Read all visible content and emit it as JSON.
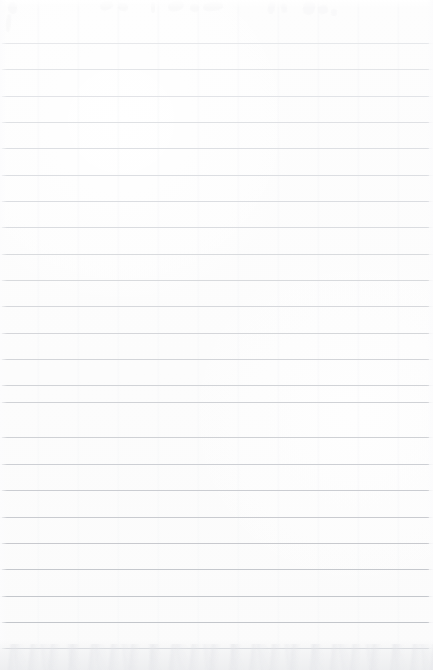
{
  "document": {
    "kind": "scanned-ruled-paper",
    "title": "",
    "text_content": "",
    "has_text": false,
    "note": ""
  },
  "page": {
    "width": 433,
    "height": 670,
    "background_color": "#fdfdfd",
    "paper_tint": "#fcfcfc"
  },
  "ruling": {
    "line_count": 24,
    "first_line_y": 43,
    "spacing": 26.3,
    "line_thickness": 1,
    "line_start_x": 2,
    "line_end_x": 429,
    "color_top": "#e2e4e7",
    "color_middle": "#d9dbdf",
    "color_bottom": "#c3c6cb",
    "lines": [
      {
        "index": 1,
        "y": 43,
        "color": "#e3e5e8",
        "opacity": 0.85,
        "x1": 2,
        "x2": 429
      },
      {
        "index": 2,
        "y": 69,
        "color": "#e0e2e6",
        "opacity": 0.88,
        "x1": 2,
        "x2": 429
      },
      {
        "index": 3,
        "y": 96,
        "color": "#dfe1e5",
        "opacity": 0.9,
        "x1": 2,
        "x2": 429
      },
      {
        "index": 4,
        "y": 122,
        "color": "#dcdee2",
        "opacity": 0.9,
        "x1": 2,
        "x2": 429
      },
      {
        "index": 5,
        "y": 148,
        "color": "#dbdde1",
        "opacity": 0.92,
        "x1": 2,
        "x2": 429
      },
      {
        "index": 6,
        "y": 175,
        "color": "#dadce0",
        "opacity": 0.92,
        "x1": 2,
        "x2": 429
      },
      {
        "index": 7,
        "y": 201,
        "color": "#d9dbdf",
        "opacity": 0.93,
        "x1": 2,
        "x2": 429
      },
      {
        "index": 8,
        "y": 227,
        "color": "#d8dade",
        "opacity": 0.93,
        "x1": 2,
        "x2": 429
      },
      {
        "index": 9,
        "y": 254,
        "color": "#d7d9dd",
        "opacity": 0.94,
        "x1": 2,
        "x2": 429
      },
      {
        "index": 10,
        "y": 280,
        "color": "#d6d8dc",
        "opacity": 0.94,
        "x1": 2,
        "x2": 429
      },
      {
        "index": 11,
        "y": 306,
        "color": "#d5d7db",
        "opacity": 0.95,
        "x1": 2,
        "x2": 429
      },
      {
        "index": 12,
        "y": 333,
        "color": "#d3d5d9",
        "opacity": 0.95,
        "x1": 2,
        "x2": 429
      },
      {
        "index": 13,
        "y": 359,
        "color": "#d2d4d8",
        "opacity": 0.96,
        "x1": 2,
        "x2": 429
      },
      {
        "index": 14,
        "y": 385,
        "color": "#d0d2d6",
        "opacity": 0.96,
        "x1": 2,
        "x2": 429
      },
      {
        "index": 15,
        "y": 402,
        "color": "#cfd1d5",
        "opacity": 0.97,
        "x1": 2,
        "x2": 429
      },
      {
        "index": 16,
        "y": 437,
        "color": "#ced0d4",
        "opacity": 0.97,
        "x1": 2,
        "x2": 429
      },
      {
        "index": 17,
        "y": 464,
        "color": "#ccced3",
        "opacity": 0.97,
        "x1": 2,
        "x2": 429
      },
      {
        "index": 18,
        "y": 490,
        "color": "#cbcdd2",
        "opacity": 0.98,
        "x1": 2,
        "x2": 429
      },
      {
        "index": 19,
        "y": 517,
        "color": "#c9cbd0",
        "opacity": 0.98,
        "x1": 2,
        "x2": 429
      },
      {
        "index": 20,
        "y": 543,
        "color": "#c7c9ce",
        "opacity": 0.98,
        "x1": 2,
        "x2": 429
      },
      {
        "index": 21,
        "y": 569,
        "color": "#c5c8cd",
        "opacity": 0.99,
        "x1": 2,
        "x2": 429
      },
      {
        "index": 22,
        "y": 596,
        "color": "#c4c7cc",
        "opacity": 0.99,
        "x1": 2,
        "x2": 429
      },
      {
        "index": 23,
        "y": 622,
        "color": "#c3c6cb",
        "opacity": 1.0,
        "x1": 2,
        "x2": 429
      },
      {
        "index": 24,
        "y": 648,
        "color": "#c8cbd0",
        "opacity": 0.9,
        "x1": 2,
        "x2": 429
      }
    ]
  },
  "artifacts": {
    "top_ghost_marks": {
      "description": "illegible faint bleed-through marks",
      "color": "#f7f7f8",
      "marks": [
        {
          "x": 8,
          "y": 2,
          "w": 9,
          "h": 12,
          "rot": -8
        },
        {
          "x": 6,
          "y": 14,
          "w": 5,
          "h": 18,
          "rot": 4
        },
        {
          "x": 100,
          "y": 1,
          "w": 13,
          "h": 9,
          "rot": -22
        },
        {
          "x": 118,
          "y": 3,
          "w": 10,
          "h": 8,
          "rot": 12
        },
        {
          "x": 151,
          "y": 2,
          "w": 4,
          "h": 11,
          "rot": 0
        },
        {
          "x": 168,
          "y": 1,
          "w": 16,
          "h": 10,
          "rot": -14
        },
        {
          "x": 190,
          "y": 4,
          "w": 9,
          "h": 8,
          "rot": 18
        },
        {
          "x": 203,
          "y": 2,
          "w": 20,
          "h": 9,
          "rot": -6
        },
        {
          "x": 268,
          "y": 1,
          "w": 7,
          "h": 13,
          "rot": 8
        },
        {
          "x": 281,
          "y": 3,
          "w": 6,
          "h": 10,
          "rot": -10
        },
        {
          "x": 303,
          "y": 1,
          "w": 12,
          "h": 14,
          "rot": 14
        },
        {
          "x": 318,
          "y": 5,
          "w": 10,
          "h": 9,
          "rot": -18
        },
        {
          "x": 331,
          "y": 9,
          "w": 6,
          "h": 7,
          "rot": 6
        }
      ]
    },
    "bottom_shading": {
      "description": "faint mottled gray shading along bottom edge",
      "start_y": 640,
      "color": "#eceef0"
    }
  }
}
